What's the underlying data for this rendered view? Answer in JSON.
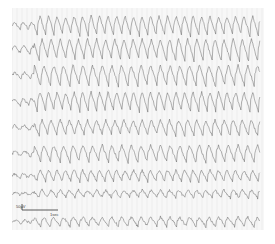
{
  "figure": {
    "type": "eeg-recording",
    "channels": 9,
    "calibration": {
      "amplitude_label": "50µV",
      "time_label": "1sec"
    },
    "colors": {
      "paper": "#f7f7f7",
      "trace": "#555555",
      "gridline": "#e2e2e2"
    }
  }
}
